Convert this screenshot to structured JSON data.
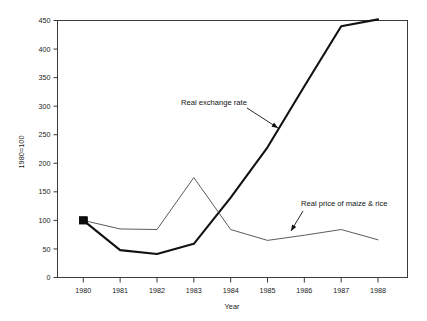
{
  "chart_data": {
    "type": "line",
    "title": "",
    "xlabel": "Year",
    "ylabel": "1980=100",
    "x": [
      1980,
      1981,
      1982,
      1983,
      1984,
      1985,
      1986,
      1987,
      1988
    ],
    "xtick_labels": [
      "1980",
      "1981",
      "1982",
      "1983",
      "1984",
      "1985",
      "1986",
      "1987",
      "1988"
    ],
    "ytick_labels": [
      "0",
      "50",
      "100",
      "150",
      "200",
      "250",
      "300",
      "350",
      "400",
      "450"
    ],
    "ytick_values": [
      0,
      50,
      100,
      150,
      200,
      250,
      300,
      350,
      400,
      450
    ],
    "xlim": [
      1979.3,
      1988.8
    ],
    "ylim": [
      0,
      450
    ],
    "grid": false,
    "legend_position": "inline-annotations",
    "series": [
      {
        "name": "Real exchange rate",
        "style": "thick",
        "color": "#121212",
        "marker_at_start": "filled-square",
        "values": [
          100,
          48,
          41,
          59,
          140,
          228,
          335,
          440,
          452
        ]
      },
      {
        "name": "Real price of maize & rice",
        "style": "thin",
        "color": "#4a4a4a",
        "marker_at_start": "filled-square",
        "values": [
          100,
          85,
          84,
          175,
          84,
          65,
          74,
          84,
          66
        ]
      }
    ],
    "annotations": [
      {
        "text": "Real exchange rate",
        "text_x": 181,
        "text_y": 105,
        "arrow_from_x": 247,
        "arrow_from_y": 108,
        "arrow_to_x": 278,
        "arrow_to_y": 128
      },
      {
        "text": "Real price of maize & rice",
        "text_x": 301,
        "text_y": 206,
        "arrow_from_x": 303,
        "arrow_from_y": 211,
        "arrow_to_x": 291,
        "arrow_to_y": 231
      }
    ]
  }
}
